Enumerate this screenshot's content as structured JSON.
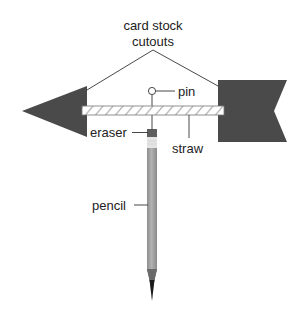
{
  "diagram": {
    "type": "labeled-illustration",
    "labels": {
      "card_stock_line1": "card stock",
      "card_stock_line2": "cutouts",
      "pin": "pin",
      "eraser": "eraser",
      "straw": "straw",
      "pencil": "pencil"
    },
    "parts": [
      {
        "id": "arrow-head",
        "label": "card stock cutouts",
        "shape": "triangle"
      },
      {
        "id": "arrow-tail",
        "label": "card stock cutouts",
        "shape": "notched-rectangle"
      },
      {
        "id": "straw",
        "label": "straw",
        "shape": "striped-bar"
      },
      {
        "id": "pin",
        "label": "pin",
        "shape": "circle-head-pin"
      },
      {
        "id": "eraser",
        "label": "eraser",
        "shape": "rectangle"
      },
      {
        "id": "pencil",
        "label": "pencil",
        "shape": "pencil"
      }
    ],
    "colors": {
      "cutout": "#4a4a4a",
      "straw_fill": "#ffffff",
      "straw_stripe": "#888888",
      "pencil_body": "#9a9a9a",
      "pencil_highlight": "#b5b5b5",
      "eraser": "#5e5e5e",
      "ferrule": "#e6e6e6",
      "lead": "#1a1a1a",
      "line": "#333333"
    }
  }
}
